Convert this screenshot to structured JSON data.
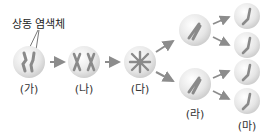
{
  "annotation": {
    "text": "상동 염색체"
  },
  "stages": [
    {
      "label": "(가)",
      "description": "homologous chromosome pair, unreplicated"
    },
    {
      "label": "(나)",
      "description": "replicated homologous chromosomes"
    },
    {
      "label": "(다)",
      "description": "chromosomes aligned / crossing"
    },
    {
      "label": "(라)",
      "description": "two cells each with one replicated chromosome"
    },
    {
      "label": "(마)",
      "description": "four cells each with one chromatid"
    }
  ],
  "colors": {
    "cell_fill": "#e8e8e8",
    "cell_edge": "#c9c9c9",
    "chromosome": "#8a8a8a",
    "arrow": "#8c8c8c",
    "text": "#333333"
  }
}
